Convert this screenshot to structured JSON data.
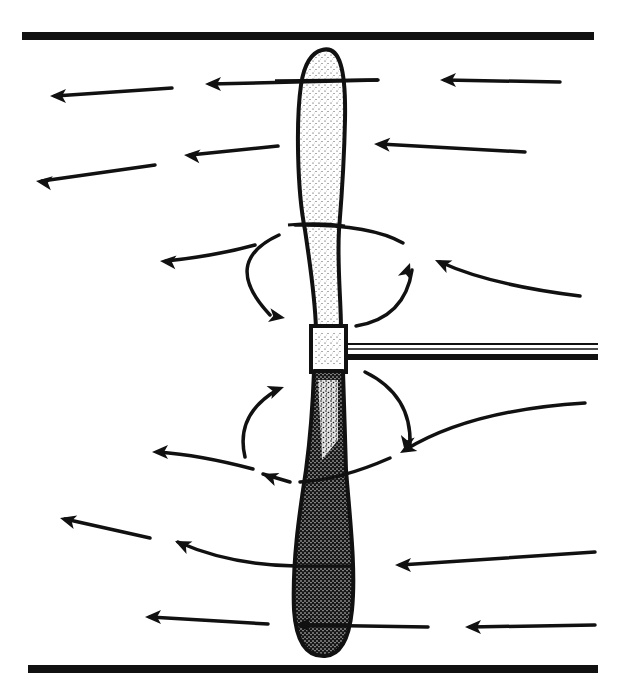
{
  "diagram": {
    "colors": {
      "ink": "#111111",
      "background": "#ffffff",
      "blade_light": "#f2f2f2",
      "blade_dark": "#3a3a3a"
    },
    "walls": [
      {
        "name": "top-wall",
        "x1": 22,
        "y1": 36,
        "x2": 594,
        "y2": 36,
        "width": 8
      },
      {
        "name": "bottom-wall",
        "x1": 28,
        "y1": 669,
        "x2": 598,
        "y2": 669,
        "width": 8
      }
    ],
    "shaft": {
      "x": 345,
      "y_top": 343,
      "y_bottom": 362,
      "x_end": 598
    },
    "hub": {
      "x": 312,
      "y": 327,
      "w": 34,
      "h": 44
    },
    "flow_arrows": [
      {
        "d": "M378,80 L210,84",
        "head": [
          205,
          84,
          180
        ]
      },
      {
        "d": "M172,88 L55,96",
        "head": [
          50,
          96,
          180
        ]
      },
      {
        "d": "M560,82 L445,80",
        "head": [
          440,
          80,
          180
        ]
      },
      {
        "d": "M278,146 L190,155",
        "head": [
          184,
          155,
          185
        ]
      },
      {
        "d": "M155,165 L42,181",
        "head": [
          36,
          181,
          188
        ]
      },
      {
        "d": "M525,152 L380,144",
        "head": [
          374,
          144,
          183
        ]
      },
      {
        "d": "M255,245 Q215,256 166,261",
        "head": [
          160,
          261,
          185
        ]
      },
      {
        "d": "M580,296 Q490,285 440,262",
        "head": [
          435,
          260,
          205
        ]
      },
      {
        "d": "M403,243 Q370,224 295,225",
        "head": null
      },
      {
        "d": "M253,469 Q200,455 158,452",
        "head": [
          152,
          452,
          180
        ]
      },
      {
        "d": "M585,403 Q470,410 405,450",
        "head": [
          400,
          453,
          150
        ]
      },
      {
        "d": "M390,458 Q340,480 300,482",
        "head": null
      },
      {
        "d": "M290,482 L263,474",
        "head": [
          262,
          474,
          200
        ]
      },
      {
        "d": "M150,538 L65,519",
        "head": [
          60,
          518,
          195
        ]
      },
      {
        "d": "M296,566 Q230,565 178,542",
        "head": [
          175,
          541,
          205
        ]
      },
      {
        "d": "M595,552 Q500,558 400,565",
        "head": [
          395,
          565,
          180
        ]
      },
      {
        "d": "M268,624 L150,617",
        "head": [
          145,
          617,
          180
        ]
      },
      {
        "d": "M428,627 L300,625",
        "head": [
          295,
          625,
          180
        ]
      },
      {
        "d": "M595,625 L470,627",
        "head": [
          465,
          627,
          180
        ]
      }
    ],
    "vortex_arrows": [
      {
        "d": "M279,235 Q220,262 270,315",
        "head": [
          285,
          318,
          10
        ]
      },
      {
        "d": "M356,326 Q405,318 412,270",
        "head": [
          410,
          263,
          290
        ]
      },
      {
        "d": "M365,372 Q412,395 410,445",
        "head": [
          405,
          452,
          100
        ]
      },
      {
        "d": "M245,457 Q235,415 277,390",
        "head": [
          284,
          387,
          340
        ]
      }
    ]
  }
}
